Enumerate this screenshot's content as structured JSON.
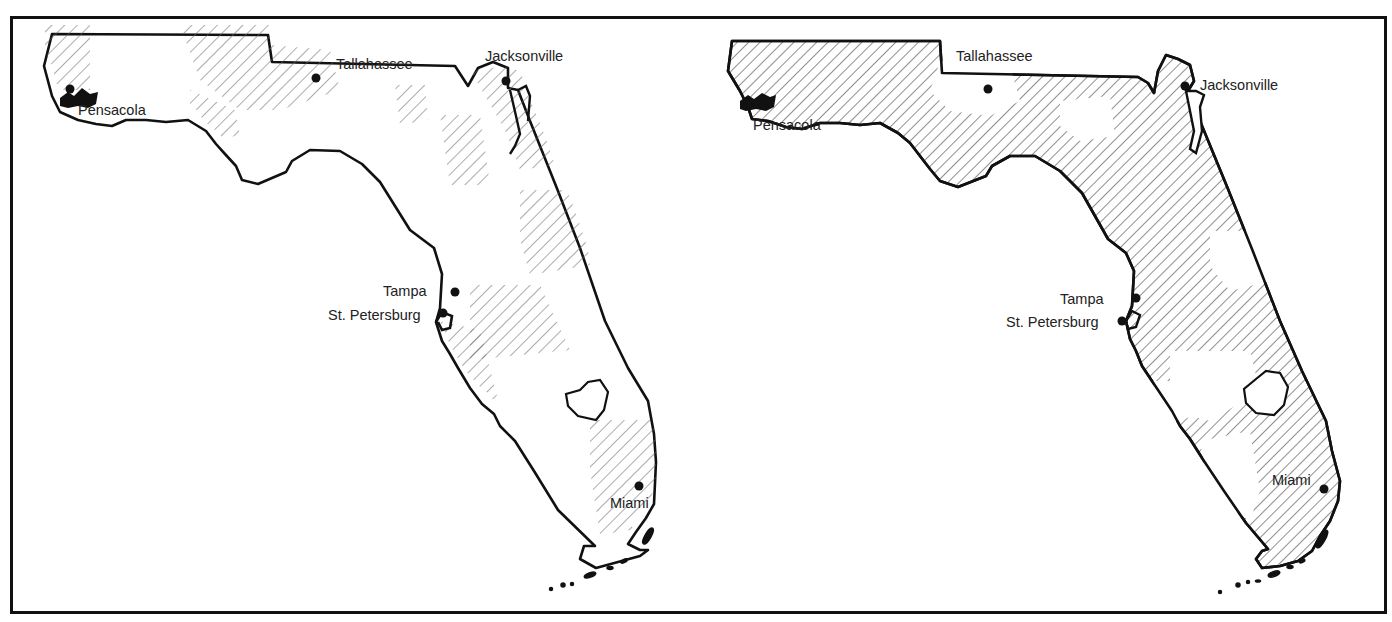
{
  "figure": {
    "panel_count": 2,
    "frame_color": "#111111",
    "hatch_color": "#555555",
    "background": "#ffffff"
  },
  "maps": {
    "left": {
      "name": "Florida map (partial hatching)",
      "cities": {
        "pensacola": "Pensacola",
        "tallahassee": "Tallahassee",
        "jacksonville": "Jacksonville",
        "tampa": "Tampa",
        "st_petersburg": "St. Petersburg",
        "miami": "Miami"
      }
    },
    "right": {
      "name": "Florida map (extensive hatching)",
      "cities": {
        "pensacola": "Pensacola",
        "tallahassee": "Tallahassee",
        "jacksonville": "Jacksonville",
        "tampa": "Tampa",
        "st_petersburg": "St. Petersburg",
        "miami": "Miami"
      }
    }
  }
}
